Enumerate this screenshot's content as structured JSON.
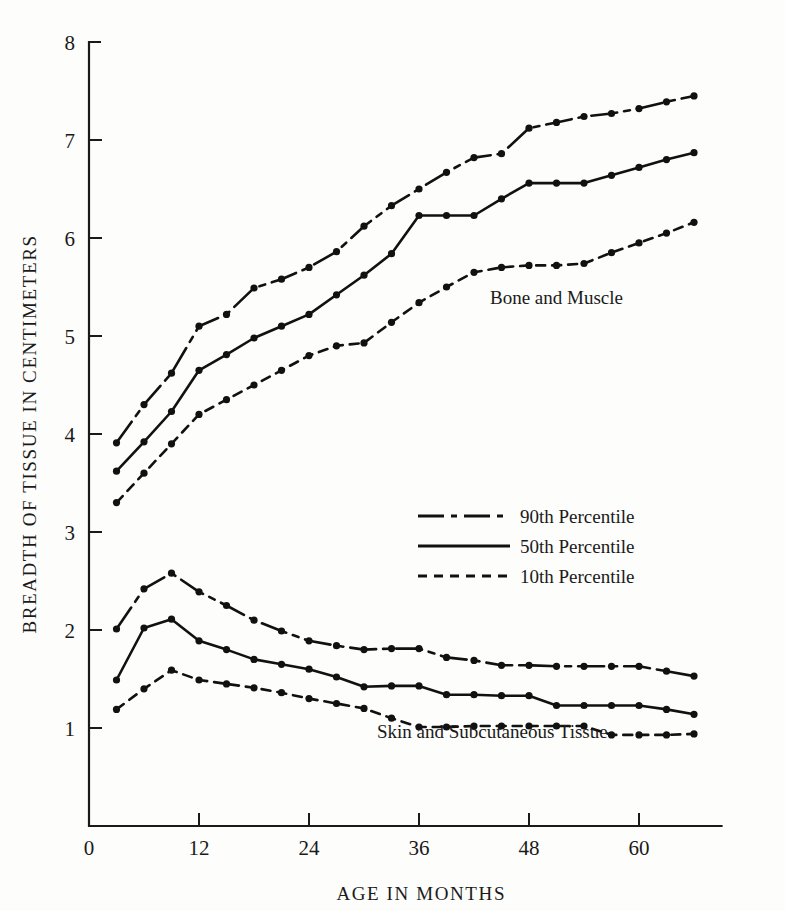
{
  "chart_data": {
    "type": "line",
    "title": "",
    "xlabel": "AGE IN MONTHS",
    "ylabel": "BREADTH OF TISSUE IN CENTIMETERS",
    "xlim": [
      0,
      69
    ],
    "ylim": [
      0,
      8
    ],
    "xticks": [
      0,
      12,
      24,
      36,
      48,
      60
    ],
    "yticks": [
      1,
      2,
      3,
      4,
      5,
      6,
      7,
      8
    ],
    "grid": false,
    "legend_position": "center",
    "legend": [
      {
        "label": "90th Percentile",
        "style": "dash-dot"
      },
      {
        "label": "50th Percentile",
        "style": "solid"
      },
      {
        "label": "10th Percentile",
        "style": "dashed"
      }
    ],
    "annotations": [
      {
        "text": "Bone and Muscle",
        "x": 51,
        "y": 5.33
      },
      {
        "text": "Skin and Subcutaneous Tissue",
        "x": 44,
        "y": 0.9
      }
    ],
    "x": [
      3,
      6,
      9,
      12,
      15,
      18,
      21,
      24,
      27,
      30,
      33,
      36,
      39,
      42,
      45,
      48,
      51,
      54,
      57,
      60,
      63,
      66
    ],
    "groups": [
      {
        "name": "Bone and Muscle",
        "series": [
          {
            "name": "90th Percentile",
            "style": "dash-dot",
            "values": [
              3.91,
              4.3,
              4.62,
              5.1,
              5.22,
              5.49,
              5.58,
              5.7,
              5.86,
              6.12,
              6.33,
              6.5,
              6.67,
              6.82,
              6.86,
              7.12,
              7.18,
              7.24,
              7.27,
              7.32,
              7.39,
              7.45
            ]
          },
          {
            "name": "50th Percentile",
            "style": "solid",
            "values": [
              3.62,
              3.92,
              4.23,
              4.65,
              4.81,
              4.98,
              5.1,
              5.22,
              5.42,
              5.62,
              5.84,
              6.23,
              6.23,
              6.23,
              6.4,
              6.56,
              6.56,
              6.56,
              6.64,
              6.72,
              6.8,
              6.87
            ]
          },
          {
            "name": "10th Percentile",
            "style": "dashed",
            "values": [
              3.3,
              3.6,
              3.9,
              4.2,
              4.35,
              4.5,
              4.65,
              4.8,
              4.9,
              4.93,
              5.14,
              5.34,
              5.5,
              5.65,
              5.7,
              5.72,
              5.72,
              5.74,
              5.85,
              5.95,
              6.05,
              6.16
            ]
          }
        ]
      },
      {
        "name": "Skin and Subcutaneous Tissue",
        "series": [
          {
            "name": "90th Percentile",
            "style": "dash-dot",
            "values": [
              2.01,
              2.42,
              2.58,
              2.39,
              2.25,
              2.1,
              1.99,
              1.89,
              1.84,
              1.8,
              1.81,
              1.81,
              1.72,
              1.69,
              1.64,
              1.64,
              1.63,
              1.63,
              1.63,
              1.63,
              1.58,
              1.53
            ]
          },
          {
            "name": "50th Percentile",
            "style": "solid",
            "values": [
              1.49,
              2.02,
              2.11,
              1.89,
              1.8,
              1.7,
              1.65,
              1.6,
              1.52,
              1.42,
              1.43,
              1.43,
              1.34,
              1.34,
              1.33,
              1.33,
              1.23,
              1.23,
              1.23,
              1.23,
              1.19,
              1.14
            ]
          },
          {
            "name": "10th Percentile",
            "style": "dashed",
            "values": [
              1.19,
              1.4,
              1.59,
              1.49,
              1.45,
              1.41,
              1.36,
              1.3,
              1.25,
              1.2,
              1.1,
              1.01,
              1.01,
              1.02,
              1.02,
              1.02,
              1.02,
              1.02,
              0.93,
              0.93,
              0.93,
              0.94
            ]
          }
        ]
      }
    ]
  }
}
